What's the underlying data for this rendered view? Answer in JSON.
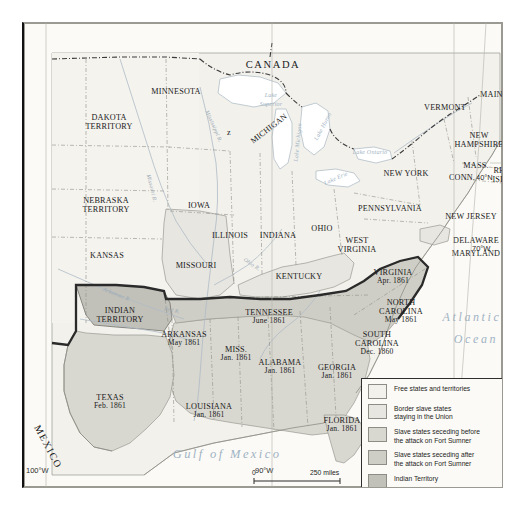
{
  "map": {
    "title": "United States Civil War Secession Map 1861",
    "background_color": "#f7f6f1",
    "countries": [
      {
        "name": "CANADA",
        "x": 248,
        "y": 44
      },
      {
        "name": "MEXICO",
        "x": 26,
        "y": 428
      }
    ],
    "water_labels": [
      {
        "name": "Atlantic",
        "x": 444,
        "y": 296
      },
      {
        "name": "Ocean",
        "x": 449,
        "y": 318
      },
      {
        "name": "Gulf of Mexico",
        "x": 192,
        "y": 435
      },
      {
        "name": "Lake",
        "x": 238,
        "y": 76
      },
      {
        "name": "Superior",
        "x": 238,
        "y": 85
      },
      {
        "name": "Lake Huron",
        "x": 297,
        "y": 108
      },
      {
        "name": "Lake Ontario",
        "x": 341,
        "y": 131
      },
      {
        "name": "Lake Erie",
        "x": 311,
        "y": 157
      },
      {
        "name": "Lake Michigan",
        "x": 272,
        "y": 122
      }
    ],
    "rivers": [
      {
        "name": "Mississippi R.",
        "x": 187,
        "y": 112
      },
      {
        "name": "Missouri R.",
        "x": 128,
        "y": 176
      },
      {
        "name": "Arkansas R.",
        "x": 92,
        "y": 277
      },
      {
        "name": "Red R.",
        "x": 150,
        "y": 292
      },
      {
        "name": "Ohio R.",
        "x": 228,
        "y": 243
      }
    ],
    "states": [
      {
        "name": "DAKOTA\nTERRITORY",
        "label": "DAKOTA",
        "label2": "TERRITORY",
        "date": "",
        "x": 85,
        "y": 95,
        "fill": "free"
      },
      {
        "name": "MINNESOTA",
        "label": "MINNESOTA",
        "label2": "",
        "date": "",
        "x": 152,
        "y": 69,
        "fill": "free"
      },
      {
        "name": "NEBRASKA TERRITORY",
        "label": "NEBRASKA",
        "label2": "TERRITORY",
        "date": "",
        "x": 82,
        "y": 178,
        "fill": "free"
      },
      {
        "name": "IOWA",
        "label": "IOWA",
        "label2": "",
        "date": "",
        "x": 175,
        "y": 183,
        "fill": "free"
      },
      {
        "name": "KANSAS",
        "label": "KANSAS",
        "label2": "",
        "date": "",
        "x": 83,
        "y": 233,
        "fill": "free"
      },
      {
        "name": "MISSOURI",
        "label": "MISSOURI",
        "label2": "",
        "date": "",
        "x": 172,
        "y": 243,
        "fill": "border"
      },
      {
        "name": "ILLINOIS",
        "label": "ILLINOIS",
        "label2": "",
        "date": "",
        "x": 206,
        "y": 213,
        "fill": "free"
      },
      {
        "name": "INDIANA",
        "label": "INDIANA",
        "label2": "",
        "date": "",
        "x": 254,
        "y": 213,
        "fill": "free"
      },
      {
        "name": "OHIO",
        "label": "OHIO",
        "label2": "",
        "date": "",
        "x": 298,
        "y": 206,
        "fill": "free"
      },
      {
        "name": "MICHIGAN",
        "label": "MICHIGAN",
        "label2": "",
        "date": "",
        "x": 245,
        "y": 106,
        "fill": "free",
        "rotate": -38
      },
      {
        "name": "WISCONSIN",
        "label": "z",
        "label2": "",
        "date": "",
        "x": 205,
        "y": 110,
        "fill": "free"
      },
      {
        "name": "KENTUCKY",
        "label": "KENTUCKY",
        "label2": "",
        "date": "",
        "x": 275,
        "y": 254,
        "fill": "border"
      },
      {
        "name": "TENNESSEE",
        "label": "TENNESSEE",
        "label2": "",
        "date": "June 1861",
        "x": 245,
        "y": 290,
        "fill": "after"
      },
      {
        "name": "WEST VIRGINIA",
        "label": "WEST",
        "label2": "VIRGINIA",
        "date": "",
        "x": 333,
        "y": 218,
        "fill": "free"
      },
      {
        "name": "VIRGINIA",
        "label": "VIRGINIA",
        "label2": "",
        "date": "Apr. 1861",
        "x": 369,
        "y": 250,
        "fill": "after"
      },
      {
        "name": "NORTH CAROLINA",
        "label": "NORTH",
        "label2": "CAROLINA",
        "date": "May 1861",
        "x": 377,
        "y": 280,
        "fill": "after"
      },
      {
        "name": "SOUTH CAROLINA",
        "label": "SOUTH",
        "label2": "CAROLINA",
        "date": "Dec. 1860",
        "x": 353,
        "y": 312,
        "fill": "before"
      },
      {
        "name": "GEORGIA",
        "label": "GEORGIA",
        "label2": "",
        "date": "Jan. 1861",
        "x": 313,
        "y": 345,
        "fill": "before"
      },
      {
        "name": "FLORIDA",
        "label": "FLORIDA",
        "label2": "",
        "date": "Jan. 1861",
        "x": 318,
        "y": 398,
        "fill": "before"
      },
      {
        "name": "ALABAMA",
        "label": "ALABAMA",
        "label2": "",
        "date": "Jan. 1861",
        "x": 256,
        "y": 340,
        "fill": "before"
      },
      {
        "name": "MISS.",
        "label": "MISS.",
        "label2": "",
        "date": "Jan. 1861",
        "x": 212,
        "y": 327,
        "fill": "before"
      },
      {
        "name": "LOUISIANA",
        "label": "LOUISIANA",
        "label2": "",
        "date": "Jan. 1861",
        "x": 185,
        "y": 384,
        "fill": "before"
      },
      {
        "name": "ARKANSAS",
        "label": "ARKANSAS",
        "label2": "",
        "date": "May 1861",
        "x": 160,
        "y": 312,
        "fill": "after"
      },
      {
        "name": "TEXAS",
        "label": "TEXAS",
        "label2": "",
        "date": "Feb. 1861",
        "x": 86,
        "y": 375,
        "fill": "before"
      },
      {
        "name": "INDIAN TERRITORY",
        "label": "INDIAN",
        "label2": "TERRITORY",
        "date": "",
        "x": 96,
        "y": 288,
        "fill": "indian"
      },
      {
        "name": "PENNSYLVANIA",
        "label": "PENNSYLVANIA",
        "label2": "",
        "date": "",
        "x": 366,
        "y": 186,
        "fill": "free"
      },
      {
        "name": "NEW YORK",
        "label": "NEW YORK",
        "label2": "",
        "date": "",
        "x": 382,
        "y": 151,
        "fill": "free"
      },
      {
        "name": "VERMONT",
        "label": "VERMONT",
        "label2": "",
        "date": "",
        "x": 421,
        "y": 85,
        "fill": "free"
      },
      {
        "name": "MAINE",
        "label": "MAINE",
        "label2": "",
        "date": "",
        "x": 470,
        "y": 72,
        "fill": "free"
      },
      {
        "name": "NEW HAMPSHIRE",
        "label": "NEW",
        "label2": "HAMPSHIRE",
        "date": "",
        "x": 455,
        "y": 113,
        "fill": "free"
      },
      {
        "name": "MASS.",
        "label": "MASS.",
        "label2": "",
        "date": "",
        "x": 452,
        "y": 143,
        "fill": "free"
      },
      {
        "name": "CONN.",
        "label": "CONN.",
        "label2": "",
        "date": "",
        "x": 438,
        "y": 155,
        "fill": "free"
      },
      {
        "name": "RHODE ISLAND",
        "label": "RHODE",
        "label2": "ISLAND",
        "date": "",
        "x": 484,
        "y": 148,
        "fill": "free"
      },
      {
        "name": "NEW JERSEY",
        "label": "NEW JERSEY",
        "label2": "",
        "date": "",
        "x": 447,
        "y": 194,
        "fill": "free"
      },
      {
        "name": "DELAWARE",
        "label": "DELAWARE",
        "label2": "",
        "date": "",
        "x": 452,
        "y": 218,
        "fill": "border"
      },
      {
        "name": "MARYLAND",
        "label": "MARYLAND",
        "label2": "",
        "date": "",
        "x": 452,
        "y": 231,
        "fill": "border"
      }
    ],
    "graticule": [
      {
        "label": "100°W",
        "x": 24,
        "y": 487
      },
      {
        "label": "90°W",
        "x": 253,
        "y": 487
      },
      {
        "label": "80°W",
        "x": 437,
        "y": 487
      },
      {
        "label": "70°W",
        "x": 472,
        "y": 243
      },
      {
        "label": "40°N",
        "x": 476,
        "y": 172
      }
    ]
  },
  "legend": {
    "items": [
      {
        "label": "Free states and territories",
        "label2": "",
        "color": "#f2f1ec",
        "type": "swatch"
      },
      {
        "label": "Border slave states",
        "label2": "staying in the Union",
        "color": "#e7e6e0",
        "type": "swatch"
      },
      {
        "label": "Slave states seceding before",
        "label2": "the attack on Fort Sumner",
        "color": "#d8d7d0",
        "type": "swatch"
      },
      {
        "label": "Slave states seceding after",
        "label2": "the attack on Fort Sumner",
        "color": "#cfcec6",
        "type": "swatch"
      },
      {
        "label": "Indian Territory",
        "label2": "",
        "color": "#c2c1b9",
        "type": "swatch"
      },
      {
        "label": "Confederacy border",
        "label2": "",
        "color": "#2a2a2a",
        "type": "line"
      }
    ]
  },
  "scale": {
    "miles_zero": "0",
    "miles_label": "250 miles",
    "km_zero": "0",
    "km_label": "250 kilometers"
  },
  "colors": {
    "free": "#f2f1ec",
    "border_state": "#e7e6e0",
    "seceded_before": "#d8d7d0",
    "seceded_after": "#cfcec6",
    "indian_territory": "#c2c1b9",
    "water": "#ffffff",
    "confederacy_border": "#2a2a2a",
    "outline": "#8f8f87"
  }
}
